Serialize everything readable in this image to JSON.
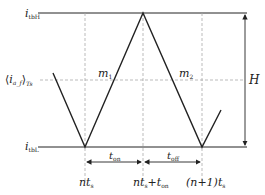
{
  "labels": {
    "top_level": {
      "main": "i",
      "sub": "tbH"
    },
    "bottom_level": {
      "main": "i",
      "sub": "tbL"
    },
    "average": {
      "open": "⟨",
      "main": "i",
      "sub": "a_f",
      "close": "⟩",
      "sub2": "Ts"
    },
    "slope_rise": {
      "main": "m",
      "sub": "1"
    },
    "slope_fall": {
      "main": "m",
      "sub": "2"
    },
    "amplitude": "H",
    "t_on": {
      "main": "t",
      "sub": "on"
    },
    "t_off": {
      "main": "t",
      "sub": "off"
    },
    "x_tick_1": {
      "main": "nt",
      "sub": "s"
    },
    "x_tick_2": {
      "main": "nt",
      "sub": "s",
      "tail": "+t",
      "tail_sub": "on"
    },
    "x_tick_3": {
      "main": "(n+1)t",
      "sub": "s"
    }
  },
  "colors": {
    "line": "#222222",
    "dashed": "#aaaaaa"
  }
}
